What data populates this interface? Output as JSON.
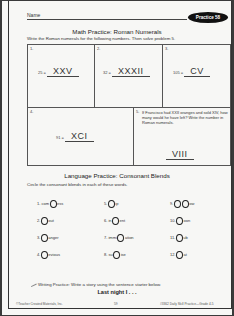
{
  "header": {
    "name_label": "Name",
    "badge": "Practice 58"
  },
  "math": {
    "title": "Math Practice:  Roman Numerals",
    "instructions": "Write the Roman numerals for the following numbers.  Then solve problem 5.",
    "problems": [
      {
        "num": "1.",
        "number": "25 =",
        "answer": "XXV"
      },
      {
        "num": "2.",
        "number": "32 =",
        "answer": "XXXII"
      },
      {
        "num": "3.",
        "number": "105 =",
        "answer": "CV"
      },
      {
        "num": "4.",
        "number": "91 =",
        "answer": "XCI"
      },
      {
        "num": "5.",
        "text": "If Francisco had XXII oranges and sold XIV, how many would he have left? Write the number in Roman numerals.",
        "answer": "VIII"
      }
    ]
  },
  "language": {
    "title": "Language Practice:  Consonant Blends",
    "instructions": "Circle the consonant blends in each of these words.",
    "words": [
      {
        "num": "1.",
        "pre": "com",
        "post": "ess"
      },
      {
        "num": "2.",
        "pre": "",
        "post": "out"
      },
      {
        "num": "3.",
        "pre": "",
        "post": "anger"
      },
      {
        "num": "4.",
        "pre": "",
        "post": "evious"
      },
      {
        "num": "5.",
        "pre": "",
        "post": "ip"
      },
      {
        "num": "6.",
        "pre": "in",
        "post": "ent"
      },
      {
        "num": "7.",
        "pre": "immi",
        "post": "ation"
      },
      {
        "num": "8.",
        "pre": "su",
        "post": "ise"
      },
      {
        "num": "9.",
        "pre": "",
        "post": "ow"
      },
      {
        "num": "10.",
        "pre": "",
        "post": "oon"
      },
      {
        "num": "11.",
        "pre": "",
        "post": "ub"
      },
      {
        "num": "12.",
        "pre": "",
        "post": "at"
      }
    ]
  },
  "writing": {
    "instructions": "Writing Practice:  Write a story using the sentence starter below.",
    "starter": "Last night I . . ."
  },
  "footer": {
    "left": "©Teacher Created Materials, Inc.",
    "center": "59",
    "right": "#3362 Daily Skill Practice—Grade 4-5"
  }
}
